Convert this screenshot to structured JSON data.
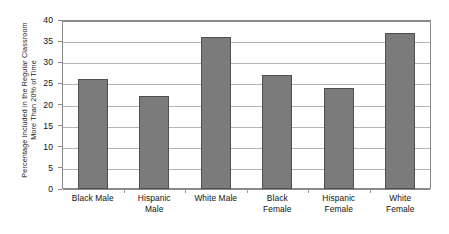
{
  "chart_data": {
    "type": "bar",
    "title": "",
    "xlabel": "",
    "ylabel": "Percentage Included in the Regular Classroom More Than 20% of Time",
    "ylabel_lines": [
      "Percentage Included in the Regular Classroom",
      "More Than 20% of Time"
    ],
    "categories": [
      "Black Male",
      "Hispanic Male",
      "White Male",
      "Black Female",
      "Hispanic Female",
      "White Female"
    ],
    "category_lines": [
      [
        "Black Male"
      ],
      [
        "Hispanic",
        "Male"
      ],
      [
        "White Male"
      ],
      [
        "Black",
        "Female"
      ],
      [
        "Hispanic",
        "Female"
      ],
      [
        "White",
        "Female"
      ]
    ],
    "values": [
      26,
      22,
      36,
      27,
      24,
      37
    ],
    "ylim": [
      0,
      40
    ],
    "ytick_labels": [
      "0",
      "5",
      "10",
      "15",
      "20",
      "25",
      "30",
      "35",
      "40"
    ],
    "ytick_values": [
      0,
      5,
      10,
      15,
      20,
      25,
      30,
      35,
      40
    ],
    "grid": true,
    "grid_axis": "y",
    "legend": false,
    "legend_position": "none",
    "bar_color": "#7b7b7b",
    "bar_border_color": "#4f4f4f",
    "gridline_color": "#b4b4b4",
    "axis_color": "#8a8a8a",
    "background_color": "#ffffff",
    "text_color": "#111111"
  }
}
